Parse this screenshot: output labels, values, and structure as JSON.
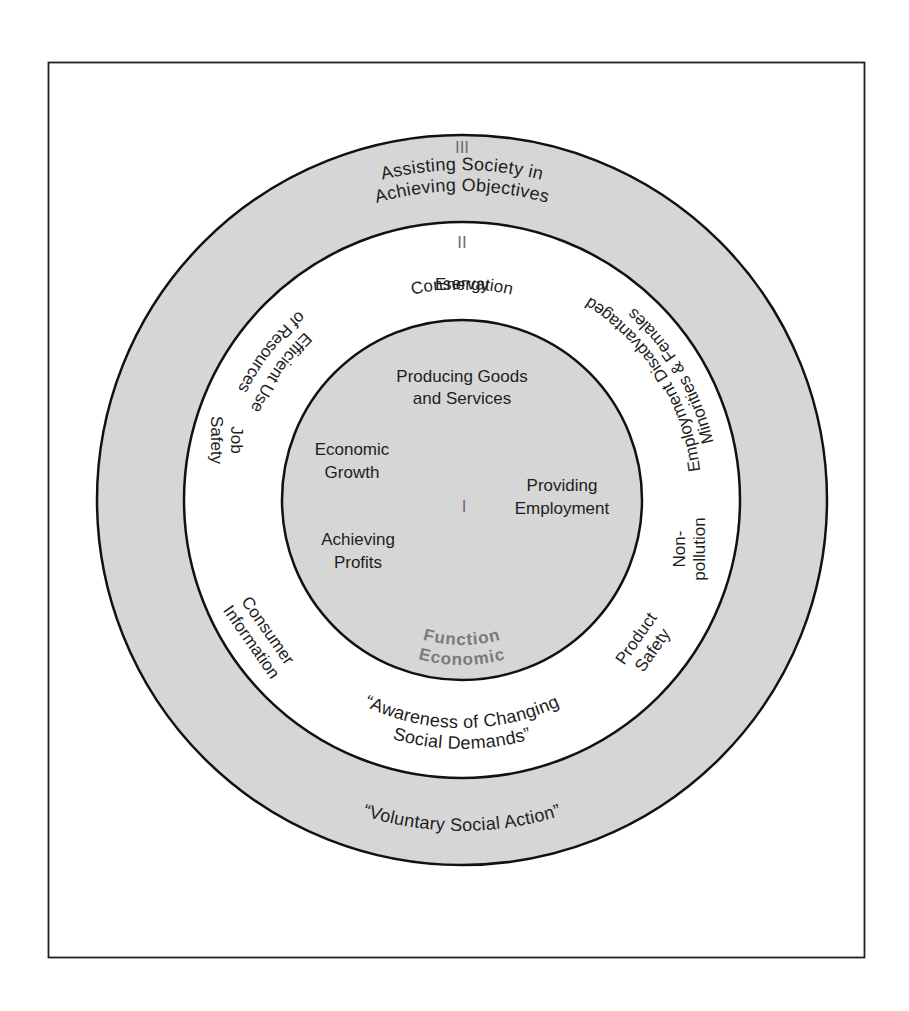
{
  "colors": {
    "background": "#ffffff",
    "frame_stroke": "#222222",
    "ring_stroke": "#111111",
    "ring_fill": "#d6d6d6",
    "inner_fill": "#d6d6d6",
    "middle_fill": "#ffffff",
    "text": "#1e1e1e",
    "numeral": "#6e6e6e",
    "function_label": "#7a7a7a"
  },
  "ring_outer": {
    "numeral": "III",
    "title_line1": "Assisting Society in",
    "title_line2": "Achieving Objectives",
    "bottom_label": "“Voluntary Social Action”"
  },
  "ring_middle": {
    "numeral": "II",
    "items": {
      "energy_line1": "Energy",
      "energy_line2": "Conservation",
      "efficient_line1": "Efficient Use",
      "efficient_line2": "of Resources",
      "employment_line1": "Employment Disadvantaged",
      "employment_line2": "Minorities & Females",
      "job_line1": "Job",
      "job_line2": "Safety",
      "nonpollution_line1": "Non-",
      "nonpollution_line2": "pollution",
      "consumer_line1": "Consumer",
      "consumer_line2": "Information",
      "product_line1": "Product",
      "product_line2": "Safety"
    },
    "bottom_line1": "“Awareness of Changing",
    "bottom_line2": "Social Demands”"
  },
  "core": {
    "numeral": "I",
    "items": {
      "producing_line1": "Producing Goods",
      "producing_line2": "and Services",
      "growth_line1": "Economic",
      "growth_line2": "Growth",
      "employment_line1": "Providing",
      "employment_line2": "Employment",
      "profits_line1": "Achieving",
      "profits_line2": "Profits"
    },
    "function_line1": "Economic",
    "function_line2": "Function"
  }
}
